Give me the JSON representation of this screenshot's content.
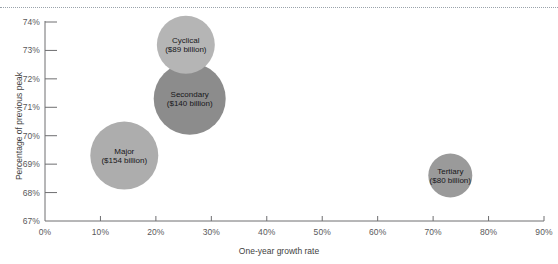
{
  "chart_data": {
    "type": "scatter",
    "variant": "bubble",
    "title": "",
    "xlabel": "One-year growth rate",
    "ylabel": "Percentage of previous peak",
    "xlim": [
      0,
      90
    ],
    "ylim": [
      67,
      74
    ],
    "grid": false,
    "legend": "none",
    "x_tick_labels": [
      "0%",
      "10%",
      "20%",
      "30%",
      "40%",
      "50%",
      "60%",
      "70%",
      "80%",
      "90%"
    ],
    "x_tick_values": [
      0,
      10,
      20,
      30,
      40,
      50,
      60,
      70,
      80,
      90
    ],
    "y_tick_labels": [
      "67%",
      "68%",
      "69%",
      "70%",
      "71%",
      "72%",
      "73%",
      "74%"
    ],
    "y_tick_values": [
      67,
      68,
      69,
      70,
      71,
      72,
      73,
      74
    ],
    "points": [
      {
        "name": "Major",
        "label_line1": "Major",
        "label_line2": "($154 billion)",
        "size_label": "$154 billion",
        "size_value": 154,
        "x": 14.3,
        "y": 69.3,
        "radius_px": 34,
        "color": "#adadad"
      },
      {
        "name": "Secondary",
        "label_line1": "Secondary",
        "label_line2": "($140 billion)",
        "size_label": "$140 billion",
        "size_value": 140,
        "x": 26.1,
        "y": 71.3,
        "radius_px": 36,
        "color": "#8c8c8c"
      },
      {
        "name": "Cyclical",
        "label_line1": "Cyclical",
        "label_line2": "($89 billion)",
        "size_label": "$89 billion",
        "size_value": 89,
        "x": 25.4,
        "y": 73.2,
        "radius_px": 29,
        "color": "#b5b5b5"
      },
      {
        "name": "Tertiary",
        "label_line1": "Tertiary",
        "label_line2": "($80 billion)",
        "size_label": "$80 billion",
        "size_value": 80,
        "x": 73.1,
        "y": 68.6,
        "radius_px": 22,
        "color": "#9a9a9a"
      }
    ]
  },
  "style": {
    "axis_color": "#6e6e70",
    "tick_color": "#6e6e70",
    "top_rule_color": "#9aa3ab",
    "background": "#ffffff",
    "label_text_color": "#17171a"
  }
}
